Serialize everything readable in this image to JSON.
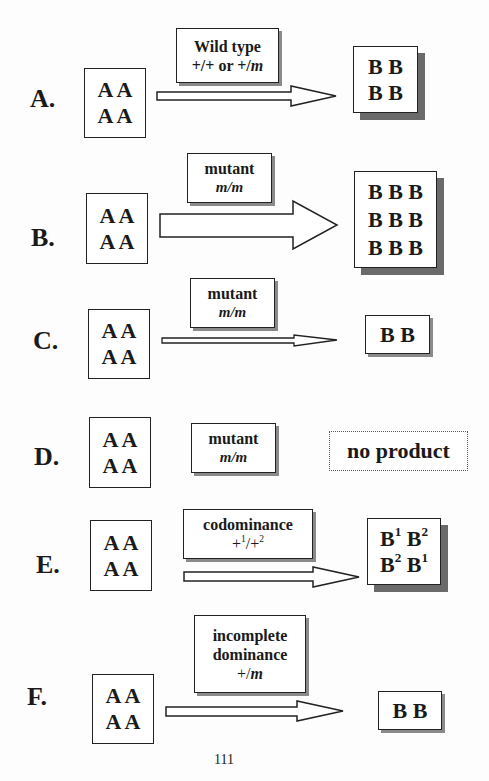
{
  "rows": [
    {
      "id": "A",
      "label": "A.",
      "input_grid": [
        "A A",
        "A A"
      ],
      "genotype_title": "Wild type",
      "genotype_sub_parts": [
        "+/+ or +/",
        "m"
      ],
      "arrow": "medium",
      "output_grid": [
        "B B",
        "B B"
      ]
    },
    {
      "id": "B",
      "label": "B.",
      "input_grid": [
        "A A",
        "A A"
      ],
      "genotype_title": "mutant",
      "genotype_sub": "m/m",
      "arrow": "large",
      "output_grid": [
        "B B B",
        "B B B",
        "B B B"
      ]
    },
    {
      "id": "C",
      "label": "C.",
      "input_grid": [
        "A A",
        "A A"
      ],
      "genotype_title": "mutant",
      "genotype_sub": "m/m",
      "arrow": "thin",
      "output_grid": [
        "B B"
      ]
    },
    {
      "id": "D",
      "label": "D.",
      "input_grid": [
        "A A",
        "A A"
      ],
      "genotype_title": "mutant",
      "genotype_sub": "m/m",
      "arrow": "none",
      "output_text": "no product"
    },
    {
      "id": "E",
      "label": "E.",
      "input_grid": [
        "A A",
        "A A"
      ],
      "genotype_title": "codominance",
      "genotype_sub_sup": [
        "+",
        "1",
        "/+",
        "2"
      ],
      "arrow": "medium",
      "output_sup_grid": [
        [
          [
            "B",
            "1"
          ],
          [
            "B",
            "2"
          ]
        ],
        [
          [
            "B",
            "2"
          ],
          [
            "B",
            "1"
          ]
        ]
      ]
    },
    {
      "id": "F",
      "label": "F.",
      "input_grid": [
        "A A",
        "A A"
      ],
      "genotype_title_lines": [
        "incomplete",
        "dominance"
      ],
      "genotype_sub_parts": [
        "+/",
        "m"
      ],
      "arrow": "medium",
      "output_grid": [
        "B B"
      ]
    }
  ],
  "page_number": "111",
  "colors": {
    "border": "#222222",
    "shadow_dark": "#6a6a6a",
    "shadow_light": "#8a8a8a",
    "background": "#fdfdfd"
  }
}
